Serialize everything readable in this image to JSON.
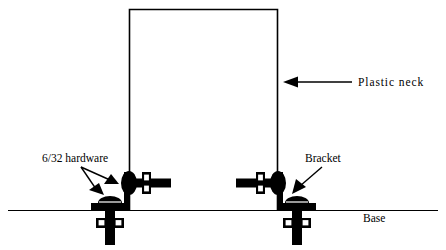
{
  "figure": {
    "type": "mechanical-assembly-diagram",
    "title": "",
    "background_color": "#ffffff",
    "line_color": "#000000",
    "width": 446,
    "height": 250
  },
  "labels": {
    "plastic_neck": "Plastic neck",
    "hardware": "6/32 hardware",
    "bracket": "Bracket",
    "base": "Base"
  },
  "parts": {
    "neck": {
      "name": "Plastic neck",
      "shape": "open-bottom rectangle",
      "left_x": 129,
      "right_x": 278,
      "top_y": 9,
      "bottom_y": 210
    },
    "base": {
      "name": "Base",
      "shape": "horizontal line",
      "y": 210,
      "start_x": 8,
      "end_x": 438
    },
    "brackets": [
      {
        "name": "left bracket",
        "orientation": "L-shape, foot pointing left",
        "corner_x": 129,
        "foot_y": 206
      },
      {
        "name": "right bracket",
        "orientation": "L-shape, foot pointing right",
        "corner_x": 278,
        "foot_y": 206
      }
    ],
    "fasteners": [
      {
        "name": "left horizontal 6/32 bolt",
        "axis": "horizontal",
        "x": 137,
        "y": 183
      },
      {
        "name": "left vertical 6/32 bolt",
        "axis": "vertical",
        "x": 110,
        "y": 212
      },
      {
        "name": "right horizontal 6/32 bolt",
        "axis": "horizontal",
        "x": 270,
        "y": 183
      },
      {
        "name": "right vertical 6/32 bolt",
        "axis": "vertical",
        "x": 297,
        "y": 212
      }
    ]
  },
  "annotations": [
    {
      "id": "plastic-neck",
      "text": "Plastic neck",
      "text_x": 358,
      "text_y": 86,
      "leader_from_x": 352,
      "leader_to_x": 283,
      "leader_y": 82,
      "arrow_direction": "left"
    },
    {
      "id": "hardware",
      "text": "6/32 hardware",
      "text_x": 42,
      "text_y": 162,
      "arrow_count": 2,
      "arrow_direction": "down-right"
    },
    {
      "id": "bracket",
      "text": "Bracket",
      "text_x": 305,
      "text_y": 162,
      "arrow_count": 1,
      "arrow_direction": "down-left"
    },
    {
      "id": "base",
      "text": "Base",
      "text_x": 363,
      "text_y": 221,
      "arrow_count": 0
    }
  ]
}
